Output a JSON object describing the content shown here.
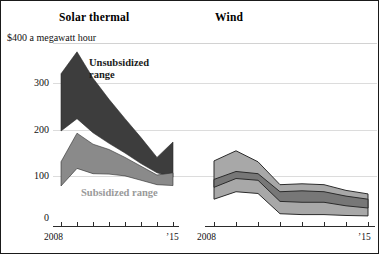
{
  "figure": {
    "background": "#ffffff",
    "border_color": "#1a1a1a"
  },
  "panels": {
    "left_title": "Solar thermal",
    "right_title": "Wind"
  },
  "axis": {
    "unit_caption": "$400 a megawatt hour",
    "y_ticks": [
      "300",
      "200",
      "100",
      "0"
    ],
    "y_tick_300": "300",
    "y_tick_200": "200",
    "y_tick_100": "100",
    "y_tick_0": "0",
    "x_start_left": "2008",
    "x_end_left": "’15",
    "x_start_right": "2008",
    "x_end_right": "’15"
  },
  "annotations": {
    "unsubsidized": "Unsubsidized\nrange",
    "subsidized": "Subsidized range"
  },
  "colors": {
    "unsubsidized_band": "#3d3d3d",
    "subsidized_band": "#8a8a8a",
    "wind_outer_band": "#a8a8a8",
    "wind_inner_band": "#777777",
    "band_outline": "#2b2b2b",
    "gridline": "#dcdcdc",
    "axis": "#2b2b2b",
    "annotation_dark": "#1b1b1b",
    "annotation_light": "#9a9a9a"
  },
  "chart_data": {
    "type": "area",
    "subtitle": "",
    "xlabel": "",
    "ylabel": "$ a megawatt hour",
    "ylim": [
      0,
      400
    ],
    "grid": true,
    "gridlines_y": [
      0,
      100,
      200,
      300,
      400
    ],
    "legend_position": "in-plot annotations",
    "panels": [
      {
        "name": "Solar thermal",
        "x": [
          2008,
          2009,
          2010,
          2011,
          2012,
          2013,
          2014,
          2015
        ],
        "xtick_labels": [
          "2008",
          "",
          "",
          "",
          "",
          "",
          "",
          "’15"
        ],
        "series": [
          {
            "name": "Unsubsidized range",
            "color": "#3d3d3d",
            "low": [
              200,
              228,
              196,
              172,
              150,
              126,
              105,
              95
            ],
            "high": [
              330,
              380,
              320,
              272,
              228,
              185,
              140,
              175
            ]
          },
          {
            "name": "Subsidized range",
            "color": "#8a8a8a",
            "low": [
              75,
              115,
              103,
              102,
              98,
              88,
              78,
              76
            ],
            "high": [
              130,
              195,
              170,
              158,
              140,
              120,
              100,
              105
            ]
          }
        ]
      },
      {
        "name": "Wind",
        "x": [
          2008,
          2009,
          2010,
          2011,
          2012,
          2013,
          2014,
          2015
        ],
        "xtick_labels": [
          "2008",
          "",
          "",
          "",
          "",
          "",
          "",
          "’15"
        ],
        "series": [
          {
            "name": "Unsubsidized range",
            "color": "#a8a8a8",
            "low": [
              45,
              62,
              58,
              12,
              10,
              10,
              8,
              7
            ],
            "high": [
              132,
              155,
              130,
              78,
              80,
              78,
              65,
              57
            ]
          },
          {
            "name": "Subsidized range",
            "color": "#777777",
            "low": [
              72,
              92,
              88,
              40,
              38,
              38,
              30,
              25
            ],
            "high": [
              90,
              108,
              103,
              62,
              64,
              62,
              52,
              45
            ]
          }
        ]
      }
    ]
  }
}
